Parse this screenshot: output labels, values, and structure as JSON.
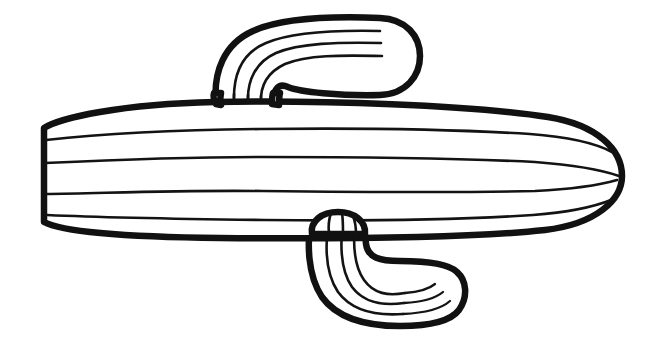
{
  "image": {
    "title": "Cactus Coloring Page Line Art",
    "subject": "cactus",
    "style": "black-and-white outline coloring-book illustration",
    "background_color": "#ffffff",
    "line_color": "#111111",
    "fill_color": "#ffffff",
    "width": 659,
    "height": 362,
    "visible_text": "",
    "orientation": "horizontal"
  },
  "parts": {
    "main_body": {
      "name": "main-trunk",
      "description": "large horizontal rounded capsule, flat cut left end, rounded right end",
      "left_end": "flat",
      "right_end": "rounded",
      "ridge_line_count": 4
    },
    "upper_arm": {
      "name": "upper-arm",
      "description": "arm rising from top of trunk then bending to the right, rounded tip",
      "tip_end": "rounded",
      "ridge_line_count": 3
    },
    "lower_arm": {
      "name": "lower-arm",
      "description": "arm descending from bottom of trunk then bending to the right, rounded tip",
      "tip_end": "rounded",
      "ridge_line_count": 3
    }
  },
  "geometry": {
    "main_body_outline": "M 44 128 L 44 222 C 60 231 120 237 220 238 C 330 239 470 238 545 230 C 596 224 622 200 622 176 C 622 150 598 125 548 117 C 470 105 320 100 215 102 C 120 104 60 118 44 128 Z",
    "main_body_ridges": [
      "M 46 140 C 110 133 180 130 260 129 C 350 128 450 129 530 134 C 570 137 597 144 612 152",
      "M 45 163 C 110 160 180 157 262 157 C 352 157 455 158 535 162 C 575 165 602 170 619 176",
      "M 45 194 C 110 193 180 190 262 191 C 352 192 455 193 535 191 C 575 189 600 185 617 180",
      "M 47 215 C 112 218 182 219 264 220 C 354 221 455 220 533 215 C 572 212 596 206 611 200"
    ],
    "upper_arm_outline": "M 216 104 C 213 72 224 44 253 31 C 282 18 330 16 380 18 C 406 19 420 36 420 56 C 420 76 406 94 380 95 C 340 96 300 92 288 87 C 277 82 273 92 272 104 Z",
    "upper_arm_ridges": [
      "M 234 102 C 233 75 242 53 266 43 C 292 32 334 30 380 31",
      "M 248 102 C 247 80 256 62 276 53 C 300 43 338 42 381 43",
      "M 261 103 C 260 86 268 72 285 64 C 307 55 340 55 382 56"
    ],
    "lower_arm_outline": "M 312 213 C 306 244 308 276 322 297 C 337 318 366 326 400 326 C 428 326 450 322 459 310 C 468 297 467 281 457 272 C 448 263 424 261 400 261 C 380 261 368 258 366 244 C 364 230 366 220 365 211 Z",
    "lower_arm_ridges": [
      "M 330 214 C 324 246 326 274 338 292 C 352 311 376 316 403 314",
      "M 344 214 C 339 246 341 271 352 287 C 364 303 382 306 404 303",
      "M 356 213 C 352 243 354 266 364 280 C 374 294 388 296 405 293"
    ],
    "lower_arm_tip_ridges": [
      "M 403 314 C 424 313 441 309 450 301",
      "M 404 303 C 422 302 436 298 443 292",
      "M 405 293 C 419 292 429 289 435 284"
    ]
  }
}
